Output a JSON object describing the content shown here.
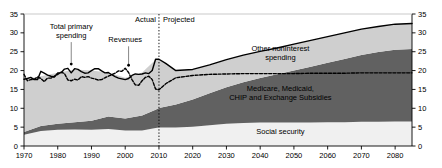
{
  "chart_data": {
    "type": "area",
    "title": "",
    "subtitle": "",
    "xlabel": "",
    "ylabel": "",
    "xlim": [
      1970,
      2085
    ],
    "ylim": [
      0,
      35
    ],
    "yticks": [
      0,
      5,
      10,
      15,
      20,
      25,
      30,
      35
    ],
    "xticks": [
      1970,
      1980,
      1990,
      2000,
      2010,
      2020,
      2030,
      2040,
      2050,
      2060,
      2070,
      2080
    ],
    "ytick_labels": [
      "0",
      "5",
      "10",
      "15",
      "20",
      "25",
      "30",
      "35"
    ],
    "xtick_labels": [
      "1970",
      "1980",
      "1990",
      "2000",
      "2010",
      "2020",
      "2030",
      "2040",
      "2050",
      "2060",
      "2070",
      "2080"
    ],
    "grid": false,
    "legend_position": "inline-annotations",
    "dual_y_axis": true,
    "divider": {
      "x": 2010,
      "style": "dotted-vertical",
      "left_label": "Actual",
      "right_label": "Projected"
    },
    "annotations": [
      {
        "name": "total-primary-spending",
        "text": "Total primary spending",
        "x": 1984,
        "y": 31,
        "leader_to_x": 1984,
        "leader_to_y": 21.5
      },
      {
        "name": "revenues",
        "text": "Revenues",
        "x": 2000,
        "y": 27.5,
        "leader_to_x": 2001,
        "leader_to_y": 21.2
      },
      {
        "name": "other-noninterest-spending",
        "text": "Other noninterest spending",
        "x": 2046,
        "y": 25.3
      },
      {
        "name": "medicare-medicaid-chip",
        "text": "Medicare, Medicaid, CHIP and Exchange Subsidies",
        "x": 2046,
        "y": 14.5
      },
      {
        "name": "social-security",
        "text": "Social security",
        "x": 2046,
        "y": 3.2
      }
    ],
    "colors": {
      "social_security": "#f0f0f0",
      "health_programs": "#616161",
      "other_noninterest": "#cfcfcf",
      "spending_line": "#000000",
      "revenues_line": "#000000",
      "axis": "#000000",
      "background": "#ffffff"
    },
    "series": [
      {
        "name": "Social security",
        "stack_order": 1,
        "fill": "#f0f0f0",
        "x": [
          1970,
          1975,
          1980,
          1985,
          1990,
          1995,
          2000,
          2005,
          2009,
          2010,
          2015,
          2020,
          2025,
          2030,
          2035,
          2040,
          2045,
          2050,
          2055,
          2060,
          2065,
          2070,
          2075,
          2080,
          2085
        ],
        "values": [
          3.0,
          4.0,
          4.3,
          4.4,
          4.3,
          4.5,
          4.1,
          4.1,
          4.8,
          4.9,
          4.9,
          5.1,
          5.5,
          5.9,
          6.1,
          6.2,
          6.2,
          6.2,
          6.2,
          6.3,
          6.3,
          6.4,
          6.4,
          6.5,
          6.5
        ]
      },
      {
        "name": "Medicare, Medicaid, CHIP and Exchange Subsidies",
        "stack_order": 2,
        "fill": "#616161",
        "x": [
          1970,
          1975,
          1980,
          1985,
          1990,
          1995,
          2000,
          2005,
          2009,
          2010,
          2015,
          2020,
          2025,
          2030,
          2035,
          2040,
          2045,
          2050,
          2055,
          2060,
          2065,
          2070,
          2075,
          2080,
          2085
        ],
        "values": [
          0.7,
          1.3,
          1.6,
          1.9,
          2.4,
          3.3,
          3.2,
          4.0,
          4.8,
          5.2,
          6.1,
          7.2,
          8.5,
          9.7,
          10.8,
          11.8,
          12.8,
          13.8,
          14.8,
          15.8,
          16.8,
          17.7,
          18.5,
          19.0,
          19.2
        ]
      },
      {
        "name": "Other noninterest spending",
        "stack_order": 3,
        "fill": "#cfcfcf",
        "x": [
          1970,
          1975,
          1980,
          1985,
          1990,
          1995,
          2000,
          2005,
          2009,
          2010,
          2015,
          2020,
          2025,
          2030,
          2035,
          2040,
          2045,
          2050,
          2055,
          2060,
          2065,
          2070,
          2075,
          2080,
          2085
        ],
        "values": [
          14.0,
          13.2,
          13.5,
          14.0,
          13.3,
          11.7,
          10.8,
          11.4,
          13.3,
          12.9,
          9.0,
          8.0,
          7.5,
          7.3,
          7.2,
          7.1,
          7.0,
          7.0,
          7.0,
          6.9,
          6.9,
          6.9,
          6.8,
          6.8,
          6.8
        ]
      }
    ],
    "lines": [
      {
        "name": "Total primary spending",
        "style": "solid",
        "width": 1.4,
        "x": [
          1970,
          1971,
          1972,
          1973,
          1974,
          1975,
          1976,
          1977,
          1978,
          1979,
          1980,
          1981,
          1982,
          1983,
          1984,
          1985,
          1986,
          1987,
          1988,
          1989,
          1990,
          1991,
          1992,
          1993,
          1994,
          1995,
          1996,
          1997,
          1998,
          1999,
          2000,
          2001,
          2002,
          2003,
          2004,
          2005,
          2006,
          2007,
          2008,
          2009,
          2010,
          2012,
          2015,
          2020,
          2025,
          2030,
          2035,
          2040,
          2045,
          2050,
          2055,
          2060,
          2065,
          2070,
          2075,
          2080,
          2085
        ],
        "values": [
          17.7,
          17.9,
          18.2,
          17.6,
          17.6,
          19.8,
          19.3,
          18.8,
          18.5,
          18.3,
          19.4,
          19.4,
          20.4,
          20.6,
          19.4,
          20.5,
          20.3,
          19.7,
          19.3,
          19.4,
          20.0,
          20.5,
          20.5,
          19.9,
          19.4,
          19.5,
          18.9,
          18.4,
          18.0,
          17.8,
          17.6,
          17.9,
          18.7,
          19.1,
          19.0,
          19.1,
          19.4,
          19.2,
          20.0,
          23.0,
          23.0,
          21.9,
          20.0,
          20.3,
          21.5,
          22.9,
          24.1,
          25.1,
          26.0,
          27.0,
          28.0,
          29.0,
          30.0,
          31.0,
          31.7,
          32.3,
          32.5
        ],
        "label": "Total primary spending"
      },
      {
        "name": "Revenues",
        "style": "dashed",
        "width": 1.4,
        "x": [
          1970,
          1971,
          1972,
          1973,
          1974,
          1975,
          1976,
          1977,
          1978,
          1979,
          1980,
          1981,
          1982,
          1983,
          1984,
          1985,
          1986,
          1987,
          1988,
          1989,
          1990,
          1991,
          1992,
          1993,
          1994,
          1995,
          1996,
          1997,
          1998,
          1999,
          2000,
          2001,
          2002,
          2003,
          2004,
          2005,
          2006,
          2007,
          2008,
          2009,
          2010,
          2012,
          2015,
          2020,
          2025,
          2030,
          2035,
          2040,
          2045,
          2050,
          2055,
          2060,
          2065,
          2070,
          2075,
          2080,
          2085
        ],
        "values": [
          19.0,
          17.3,
          17.6,
          17.7,
          18.3,
          17.9,
          17.1,
          18.0,
          18.0,
          18.5,
          19.0,
          19.6,
          19.2,
          17.5,
          17.3,
          17.7,
          17.5,
          18.4,
          18.2,
          18.4,
          18.0,
          17.8,
          17.5,
          17.6,
          18.1,
          18.5,
          18.9,
          19.3,
          19.9,
          19.8,
          20.6,
          19.5,
          17.6,
          16.2,
          16.1,
          17.3,
          18.2,
          18.5,
          17.6,
          15.1,
          14.9,
          16.5,
          18.1,
          18.7,
          19.0,
          19.1,
          19.2,
          19.2,
          19.2,
          19.2,
          19.3,
          19.3,
          19.3,
          19.4,
          19.4,
          19.4,
          19.4
        ],
        "label": "Revenues"
      }
    ]
  }
}
